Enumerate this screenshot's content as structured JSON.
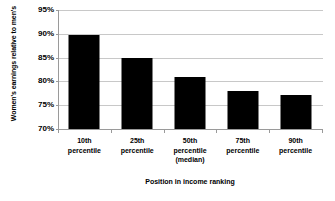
{
  "chart_data": {
    "type": "bar",
    "title": "",
    "categories": [
      "10th percentile",
      "25th percentile",
      "50th percentile (median)",
      "75th percentile",
      "90th percentile"
    ],
    "category_lines": [
      [
        "10th",
        "percentile"
      ],
      [
        "25th",
        "percentile"
      ],
      [
        "50th",
        "percentile",
        "(median)"
      ],
      [
        "75th",
        "percentile"
      ],
      [
        "90th",
        "percentile"
      ]
    ],
    "values": [
      89.7,
      84.9,
      81.0,
      78.0,
      77.2
    ],
    "value_labels": [
      "89.7%",
      "84.9%",
      "81.0%",
      "78.0%",
      "77.2%"
    ],
    "xlabel": "Position in income ranking",
    "ylabel": "Women's earnings relative to men's",
    "ylim": [
      70,
      95
    ],
    "ytick_values": [
      70,
      75,
      80,
      85,
      90,
      95
    ],
    "ytick_labels": [
      "70%",
      "75%",
      "80%",
      "85%",
      "90%",
      "95%"
    ],
    "grid": true,
    "grid_axis": "y",
    "legend": false,
    "legend_position": "none",
    "bar_color": "#000000",
    "gridline_color": "#c8c8c8",
    "axis_color": "#9a9a9a",
    "text_color": "#000000"
  }
}
